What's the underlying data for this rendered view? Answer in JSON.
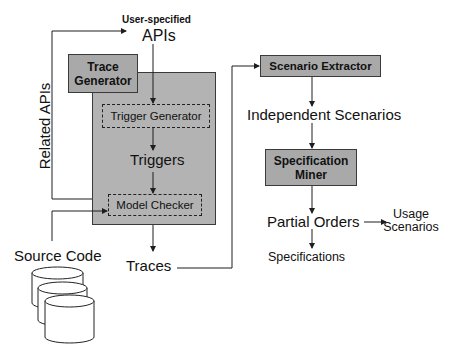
{
  "diagram": {
    "inputs": {
      "user_specified_label": "User-specified",
      "apis": "APIs",
      "related_apis": "Related APIs",
      "source_code": "Source Code"
    },
    "trace_generator": {
      "title": "Trace Generator",
      "trigger_generator": "Trigger Generator",
      "triggers": "Triggers",
      "model_checker": "Model Checker"
    },
    "traces": "Traces",
    "scenario_extractor": "Scenario Extractor",
    "independent_scenarios": "Independent Scenarios",
    "specification_miner": "Specification Miner",
    "partial_orders": "Partial Orders",
    "usage_scenarios": "Usage Scenarios",
    "specifications": "Specifications",
    "icons": {
      "source_code_store": "database-cylinders-icon"
    }
  },
  "colors": {
    "box_fill": "#b3b3b3",
    "label_fill": "#a9a9a9",
    "line": "#1e1e1e",
    "border": "#3a3a3a",
    "background": "#ffffff"
  }
}
